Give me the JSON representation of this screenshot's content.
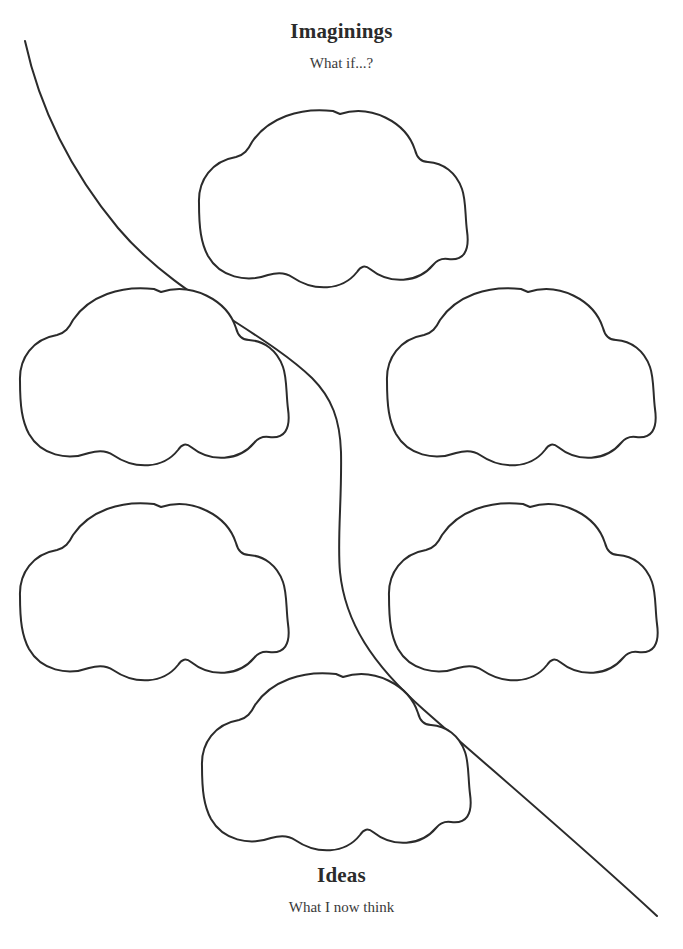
{
  "page": {
    "title": "Imaginings",
    "background_color": "#ffffff",
    "ink_color": "#2b2b2b",
    "width": 683,
    "height": 949
  },
  "header": {
    "heading": "Imaginings",
    "subheading": "What if...?"
  },
  "footer": {
    "heading": "Ideas",
    "subheading": "What I now think"
  },
  "clouds": [
    {
      "id": "cloud-top-center",
      "label": "",
      "placeholder": ""
    },
    {
      "id": "cloud-middle-left",
      "label": "",
      "placeholder": ""
    },
    {
      "id": "cloud-middle-right",
      "label": "",
      "placeholder": ""
    },
    {
      "id": "cloud-lower-left",
      "label": "",
      "placeholder": ""
    },
    {
      "id": "cloud-lower-right",
      "label": "",
      "placeholder": ""
    },
    {
      "id": "cloud-bottom-center",
      "label": "",
      "placeholder": ""
    }
  ],
  "divider": {
    "name": "flowing-path",
    "description": "S-curve from upper left to lower right"
  }
}
